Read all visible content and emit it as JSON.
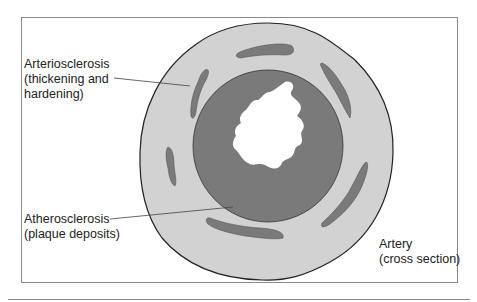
{
  "labels": {
    "arteriosclerosis": {
      "line1": "Arteriosclerosis",
      "line2": "(thickening and",
      "line3": "hardening)"
    },
    "atherosclerosis": {
      "line1": "Atherosclerosis",
      "line2": "(plaque deposits)"
    },
    "artery": {
      "line1": "Artery",
      "line2": "(cross section)"
    }
  },
  "colors": {
    "outer_wall": "#d2d2d2",
    "plaque": "#7a7a7a",
    "outline": "#222222",
    "lumen": "#ffffff"
  }
}
